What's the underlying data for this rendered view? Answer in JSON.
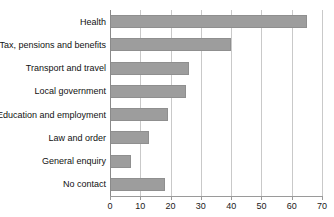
{
  "chart_data": {
    "type": "bar",
    "orientation": "horizontal",
    "title": "",
    "xlabel": "",
    "ylabel": "",
    "categories": [
      "Health",
      "Tax, pensions and benefits",
      "Transport and travel",
      "Local government",
      "Education and employment",
      "Law and order",
      "General enquiry",
      "No contact"
    ],
    "values": [
      65,
      40,
      26,
      25,
      19,
      13,
      7,
      18
    ],
    "xlim": [
      0,
      70
    ],
    "xticks": [
      0,
      10,
      20,
      30,
      40,
      50,
      60,
      70
    ],
    "xtick_labels": [
      "0",
      "10",
      "20",
      "30",
      "40",
      "50",
      "60",
      "70"
    ],
    "grid": true,
    "grid_axis": "x",
    "legend": false,
    "bar_color": "#9d9d9d",
    "bar_edge_color": "#8f8f8f",
    "axis_color": "#9a9a9a",
    "grid_color": "#c9c9c9",
    "text_color": "#111111"
  }
}
